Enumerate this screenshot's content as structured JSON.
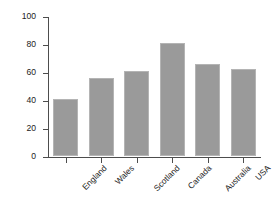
{
  "chart_data": {
    "type": "bar",
    "title": "",
    "subtitle": "",
    "xlabel": "",
    "ylabel": "Children >2 h/day screen time(%)",
    "categories": [
      "England",
      "Wales",
      "Scotland",
      "Canada",
      "Australia",
      "USA"
    ],
    "values": [
      41,
      56,
      61,
      81,
      66,
      62
    ],
    "series": [
      {
        "name": "Children >2 h/day screen time",
        "values": [
          41,
          56,
          61,
          81,
          66,
          62
        ]
      }
    ],
    "ylim": [
      0,
      100
    ],
    "yticks": [
      0,
      20,
      40,
      60,
      80,
      100
    ],
    "ytick_labels": [
      "0",
      "20",
      "40",
      "60",
      "80",
      "100"
    ],
    "grid": false,
    "legend": "none",
    "bar_color": "#9a9a9a",
    "bar_edge_color": "#b4b4b4",
    "axis_color": "#4d4d4d",
    "background_color": "#ffffff",
    "xtick_label_rotation": 45
  }
}
